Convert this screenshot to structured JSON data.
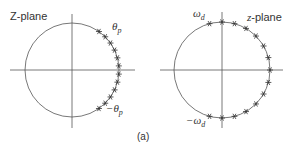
{
  "figure": {
    "caption": "(a)",
    "left_panel": {
      "title": "Z-plane",
      "upper_label": "θp",
      "upper_label_base": "θ",
      "upper_label_sub": "p",
      "lower_label_base": "−θ",
      "lower_label_sub": "p",
      "center": [
        72,
        70
      ],
      "radius": 47,
      "marker_angles_deg": [
        55,
        45,
        35,
        25,
        15,
        5,
        -5,
        -15,
        -25,
        -35,
        -45,
        -55
      ]
    },
    "right_panel": {
      "title": "z-plane",
      "upper_label_base": "ω",
      "upper_label_sub": "d",
      "lower_label_base": "−ω",
      "lower_label_sub": "d",
      "center": [
        222,
        70
      ],
      "radius": 48,
      "marker_angles_deg": [
        105,
        90,
        75,
        60,
        45,
        30,
        15,
        0,
        -15,
        -30,
        -45,
        -60,
        -75,
        -90,
        -105
      ]
    },
    "colors": {
      "line": "#555555",
      "marker": "#333333",
      "text": "#333333"
    }
  }
}
